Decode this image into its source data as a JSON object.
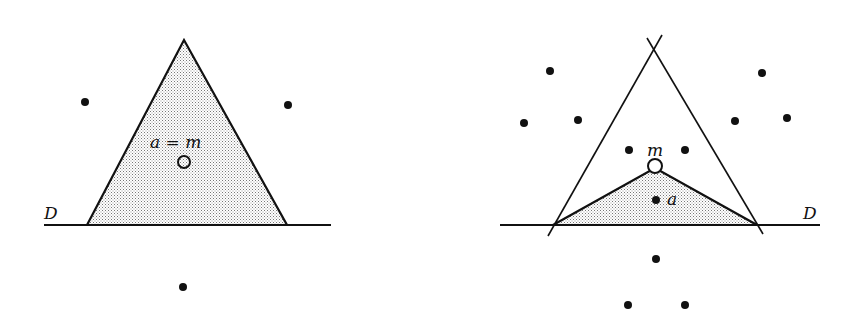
{
  "figures": [
    {
      "id": "left",
      "labels": {
        "line": "D",
        "point": "a = m"
      },
      "line": {
        "x1": 44,
        "y1": 225,
        "x2": 331,
        "y2": 225
      },
      "triangle": [
        [
          87,
          225
        ],
        [
          184,
          40
        ],
        [
          287,
          225
        ]
      ],
      "circle": {
        "cx": 184,
        "cy": 162,
        "r": 6
      },
      "dots": [
        [
          85,
          102
        ],
        [
          288,
          105
        ],
        [
          183,
          287
        ]
      ],
      "label_pos": {
        "D": [
          44,
          219
        ],
        "am": [
          150,
          148
        ]
      }
    },
    {
      "id": "right",
      "labels": {
        "line": "D",
        "m": "m",
        "a": "a"
      },
      "line": {
        "x1": 500,
        "y1": 225,
        "x2": 820,
        "y2": 225
      },
      "lines": [
        [
          548,
          236,
          662,
          35
        ],
        [
          647,
          38,
          763,
          234
        ]
      ],
      "triangle": [
        [
          553,
          225
        ],
        [
          655,
          168
        ],
        [
          757,
          225
        ]
      ],
      "circle": {
        "cx": 655,
        "cy": 166,
        "r": 7
      },
      "dots": [
        [
          550,
          71
        ],
        [
          762,
          73
        ],
        [
          524,
          123
        ],
        [
          578,
          120
        ],
        [
          735,
          121
        ],
        [
          787,
          118
        ],
        [
          629,
          150
        ],
        [
          685,
          150
        ],
        [
          656,
          200
        ],
        [
          656,
          259
        ],
        [
          628,
          305
        ],
        [
          685,
          305
        ]
      ],
      "label_pos": {
        "D": [
          803,
          219
        ],
        "m": [
          647,
          156
        ],
        "a": [
          667,
          205
        ]
      }
    }
  ],
  "colors": {
    "ink": "#111111",
    "fill": "#cfcfcf"
  }
}
